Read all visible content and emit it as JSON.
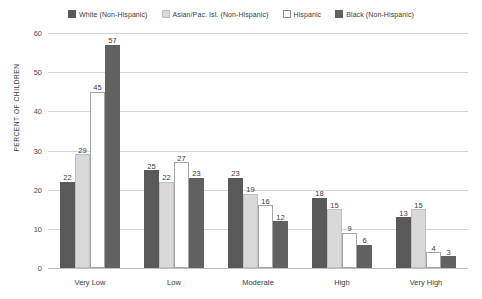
{
  "chart_data": {
    "type": "bar",
    "title": "",
    "subtitle": "",
    "xlabel": "",
    "ylabel": "PERCENT OF CHILDREN",
    "ylim": [
      0,
      60
    ],
    "yticks": [
      0,
      10,
      20,
      30,
      40,
      50,
      60
    ],
    "ytick_labels": [
      "0",
      "10",
      "20",
      "30",
      "40",
      "50",
      "60"
    ],
    "grid": true,
    "legend_position": "top-center",
    "categories": [
      "Very Low",
      "Low",
      "Moderate",
      "High",
      "Very High"
    ],
    "series": [
      {
        "name": "White (Non-Hispanic)",
        "color": "#595959",
        "border": "#595959",
        "values": [
          22,
          25,
          23,
          18,
          13
        ]
      },
      {
        "name": "Asian/Pac. Isl. (Non-Hispanic)",
        "color": "#d9d9d9",
        "border": "#bfbfbf",
        "values": [
          29,
          22,
          19,
          15,
          15
        ]
      },
      {
        "name": "Hispanic",
        "color": "#ffffff",
        "border": "#a6a6a6",
        "values": [
          45,
          27,
          16,
          9,
          4
        ]
      },
      {
        "name": "Black (Non-Hispanic)",
        "color": "#616161",
        "border": "#616161",
        "values": [
          57,
          23,
          12,
          6,
          3
        ]
      }
    ]
  },
  "legend": {
    "items": [
      {
        "label": "White (Non-Hispanic)",
        "color": "#595959",
        "border": "#595959"
      },
      {
        "label": "Asian/Pac. Isl. (Non-Hispanic)",
        "color": "#d9d9d9",
        "border": "#bfbfbf"
      },
      {
        "label": "Hispanic",
        "color": "#ffffff",
        "border": "#8c8c8c"
      },
      {
        "label": "Black (Non-Hispanic)",
        "color": "#616161",
        "border": "#616161"
      }
    ]
  }
}
